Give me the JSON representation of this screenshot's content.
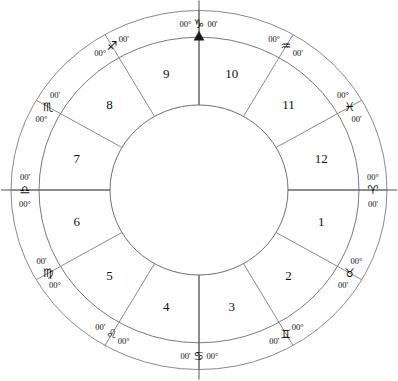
{
  "chart": {
    "type": "equal-house-wheel",
    "center_x": 199,
    "center_y": 190,
    "radius_outer": 188,
    "radius_ring_inner": 160,
    "radius_hub": 89,
    "stroke_color": "#8a8a8a",
    "text_color": "#111111",
    "background": "#ffffff",
    "degree_prefix": "00°",
    "minute_suffix": "00'",
    "mc_marker": "arrow-up"
  },
  "signs": [
    {
      "name": "Aries",
      "glyph": "♈",
      "deg": "00°",
      "min": "00'",
      "angle": 180,
      "cusp_house": 1
    },
    {
      "name": "Taurus",
      "glyph": "♉",
      "deg": "00°",
      "min": "00'",
      "angle": 210,
      "cusp_house": 2
    },
    {
      "name": "Gemini",
      "glyph": "♊",
      "deg": "00°",
      "min": "00'",
      "angle": 240,
      "cusp_house": 3
    },
    {
      "name": "Cancer",
      "glyph": "♋",
      "deg": "00°",
      "min": "00'",
      "angle": 270,
      "cusp_house": 4
    },
    {
      "name": "Leo",
      "glyph": "♌",
      "deg": "00°",
      "min": "00'",
      "angle": 300,
      "cusp_house": 5
    },
    {
      "name": "Virgo",
      "glyph": "♍",
      "deg": "00°",
      "min": "00'",
      "angle": 330,
      "cusp_house": 6
    },
    {
      "name": "Libra",
      "glyph": "♎",
      "deg": "00°",
      "min": "00'",
      "angle": 0,
      "cusp_house": 7
    },
    {
      "name": "Scorpio",
      "glyph": "♏",
      "deg": "00°",
      "min": "00'",
      "angle": 30,
      "cusp_house": 8
    },
    {
      "name": "Sagittarius",
      "glyph": "♐",
      "deg": "00°",
      "min": "00'",
      "angle": 60,
      "cusp_house": 9
    },
    {
      "name": "Capricorn",
      "glyph": "♑",
      "deg": "00°",
      "min": "00'",
      "angle": 90,
      "cusp_house": 10
    },
    {
      "name": "Aquarius",
      "glyph": "♒",
      "deg": "00°",
      "min": "00'",
      "angle": 120,
      "cusp_house": 11
    },
    {
      "name": "Pisces",
      "glyph": "♓",
      "deg": "00°",
      "min": "00'",
      "angle": 150,
      "cusp_house": 12
    }
  ],
  "houses": [
    {
      "number": "1",
      "mid_angle": 195
    },
    {
      "number": "2",
      "mid_angle": 225
    },
    {
      "number": "3",
      "mid_angle": 255
    },
    {
      "number": "4",
      "mid_angle": 285
    },
    {
      "number": "5",
      "mid_angle": 315
    },
    {
      "number": "6",
      "mid_angle": 345
    },
    {
      "number": "7",
      "mid_angle": 15
    },
    {
      "number": "8",
      "mid_angle": 45
    },
    {
      "number": "9",
      "mid_angle": 75
    },
    {
      "number": "10",
      "mid_angle": 105
    },
    {
      "number": "11",
      "mid_angle": 135
    },
    {
      "number": "12",
      "mid_angle": 165
    }
  ],
  "axes": [
    {
      "name": "ascendant",
      "label": "AC",
      "angle": 180
    },
    {
      "name": "descendant",
      "label": "DC",
      "angle": 0
    },
    {
      "name": "midheaven",
      "label": "MC",
      "angle": 90
    },
    {
      "name": "imum-coeli",
      "label": "IC",
      "angle": 270
    }
  ],
  "chart_data": {
    "type": "pie",
    "categories": [
      "1",
      "2",
      "3",
      "4",
      "5",
      "6",
      "7",
      "8",
      "9",
      "10",
      "11",
      "12"
    ],
    "values": [
      30,
      30,
      30,
      30,
      30,
      30,
      30,
      30,
      30,
      30,
      30,
      30
    ],
    "labels": [
      "Aries 00°00'",
      "Taurus 00°00'",
      "Gemini 00°00'",
      "Cancer 00°00'",
      "Leo 00°00'",
      "Virgo 00°00'",
      "Libra 00°00'",
      "Scorpio 00°00'",
      "Sagittarius 00°00'",
      "Capricorn 00°00'",
      "Aquarius 00°00'",
      "Pisces 00°00'"
    ],
    "xlabel": "",
    "ylabel": "",
    "grid": false,
    "legend": "none"
  }
}
